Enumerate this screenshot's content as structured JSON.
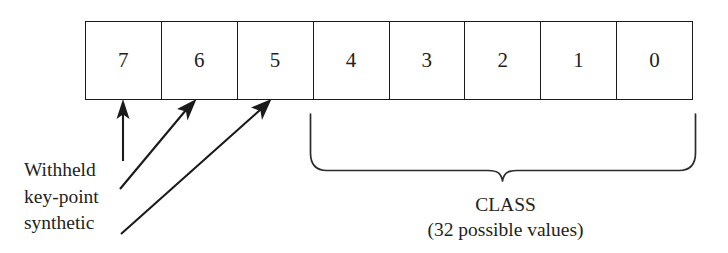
{
  "diagram": {
    "bit_boxes": {
      "name": "bit-field-row",
      "count": 8,
      "labels": [
        "7",
        "6",
        "5",
        "4",
        "3",
        "2",
        "1",
        "0"
      ]
    },
    "annotations": {
      "left_flags": {
        "lines": [
          "Withheld",
          "key-point",
          "synthetic"
        ],
        "arrow_targets": [
          "7",
          "6",
          "5"
        ],
        "arrow_count": 3
      },
      "class_field": {
        "lines": [
          "CLASS",
          "(32 possible values)"
        ],
        "brace_spans_bits": [
          "4",
          "3",
          "2",
          "1",
          "0"
        ],
        "possible_values": 32
      }
    },
    "colors": {
      "background": "#ffffff",
      "stroke": "#1a1a1a",
      "text": "#231f20",
      "brace": "#2b2b2b"
    }
  }
}
